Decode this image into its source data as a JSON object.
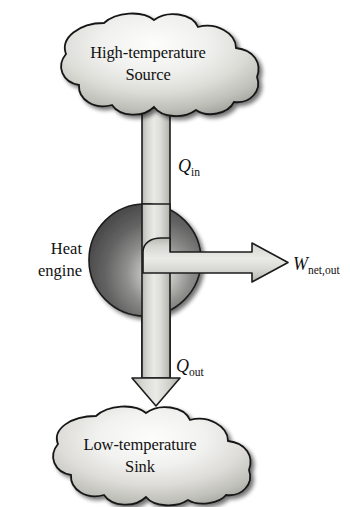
{
  "diagram": {
    "type": "thermodynamic-schematic",
    "nodes": {
      "source_cloud": {
        "name": "high-temperature-source",
        "line1": "High-temperature",
        "line2": "Source",
        "shape": "cloud"
      },
      "engine_sphere": {
        "name": "heat-engine",
        "line1": "Heat",
        "line2": "engine",
        "shape": "sphere"
      },
      "sink_cloud": {
        "name": "low-temperature-sink",
        "line1": "Low-temperature",
        "line2": "Sink",
        "shape": "cloud"
      }
    },
    "flows": {
      "q_in": {
        "name": "heat-input-arrow",
        "symbol": "Q",
        "subscript": "in",
        "direction": "down",
        "from": "High-temperature Source",
        "to": "Heat engine"
      },
      "q_out": {
        "name": "heat-rejection-arrow",
        "symbol": "Q",
        "subscript": "out",
        "direction": "down",
        "from": "Heat engine",
        "to": "Low-temperature Sink"
      },
      "w_net_out": {
        "name": "net-work-output-arrow",
        "symbol": "W",
        "subscript": "net,out",
        "direction": "right",
        "from": "Heat engine",
        "to": "surroundings"
      }
    },
    "colors": {
      "arrow_light": "#e8e8e6",
      "arrow_mid": "#c9c9c5",
      "arrow_dark": "#a9a9a4",
      "cloud_light": "#fbfbfa",
      "cloud_mid": "#d9d9d4",
      "cloud_dark": "#8d8d88",
      "sphere_light": "#d8d8d4",
      "sphere_dark": "#4a4a4a",
      "outline": "#1a1a1a",
      "text": "#111111",
      "background": "#ffffff"
    }
  }
}
